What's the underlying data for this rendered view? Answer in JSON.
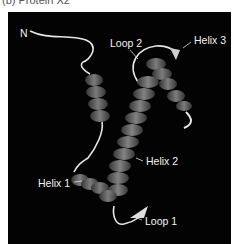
{
  "caption": "(b) Protein X2",
  "figure": {
    "background": "#030303",
    "helix_color": "#7a7a7a",
    "loop_color": "#e8e8e8",
    "labels": {
      "n_terminus": "N",
      "loop2": "Loop 2",
      "helix3": "Helix 3",
      "helix2": "Helix 2",
      "helix1": "Helix 1",
      "loop1": "Loop 1"
    }
  }
}
